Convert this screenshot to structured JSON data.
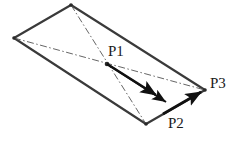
{
  "figure": {
    "background_color": "#ffffff",
    "stroke_color": "#3a3a3a",
    "dash_color": "#555555",
    "arrow_color": "#111111",
    "text_color": "#1a1a1a",
    "width": 235,
    "height": 141
  },
  "shape": {
    "name": "parallelogram",
    "vertices": [
      {
        "name": "top",
        "x": 71,
        "y": 5
      },
      {
        "name": "left",
        "x": 14,
        "y": 38
      },
      {
        "name": "bottom",
        "x": 146,
        "y": 124
      },
      {
        "name": "right",
        "x": 205,
        "y": 90
      }
    ],
    "edges": [
      {
        "name": "edge-top-right",
        "from": "top",
        "to": "right"
      },
      {
        "name": "edge-right-bottom",
        "from": "right",
        "to": "bottom"
      },
      {
        "name": "edge-bottom-left",
        "from": "bottom",
        "to": "left"
      },
      {
        "name": "edge-left-top",
        "from": "left",
        "to": "top"
      }
    ],
    "diagonals": [
      {
        "name": "diagonal-top-bottom",
        "from": "top",
        "to": "bottom",
        "style": "dash-dot"
      },
      {
        "name": "diagonal-left-right",
        "from": "left",
        "to": "right",
        "style": "dash-dot"
      }
    ]
  },
  "points": {
    "p1": {
      "label": "P1",
      "x": 107,
      "y": 64,
      "label_x": 108,
      "label_y": 44
    },
    "p2": {
      "label": "P2",
      "x": 169,
      "y": 104,
      "label_x": 168,
      "label_y": 116
    },
    "p3": {
      "label": "P3",
      "x": 205,
      "y": 90,
      "label_x": 210,
      "label_y": 76
    }
  },
  "vectors": [
    {
      "name": "vector-p1-to-interior",
      "from_x": 107,
      "from_y": 64,
      "to_x": 159,
      "to_y": 97,
      "style": "bold-solid-arrow"
    },
    {
      "name": "vector-p1-to-p2",
      "from_x": 107,
      "from_y": 64,
      "to_x": 169,
      "to_y": 104,
      "style": "bold-solid-arrow"
    },
    {
      "name": "vector-p2-to-p3",
      "from_x": 166,
      "from_y": 112,
      "to_x": 204,
      "to_y": 90,
      "style": "bold-solid-arrow"
    }
  ]
}
